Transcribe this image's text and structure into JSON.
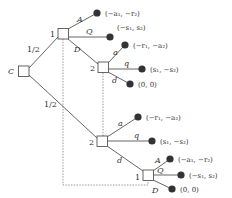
{
  "diagram": {
    "type": "extensive-form game tree",
    "colors": {
      "line": "#555555",
      "dotted": "#888888",
      "leaf": "#333333",
      "background": "#ffffff"
    },
    "nodes": {
      "chance": {
        "label": "C"
      },
      "p1_top": {
        "label": "1"
      },
      "p2_upper": {
        "label": "2"
      },
      "p2_lower": {
        "label": "2"
      },
      "p1_bottom": {
        "label": "1"
      }
    },
    "chance_probs": {
      "up": "1/2",
      "down": "1/2"
    },
    "actions": {
      "p1_top": {
        "A": "A",
        "Q": "Q",
        "D": "D"
      },
      "p2_upper": {
        "a": "a",
        "q": "q",
        "d": "d"
      },
      "p2_lower": {
        "a": "a",
        "q": "q",
        "d": "d"
      },
      "p1_bottom": {
        "A": "A",
        "Q": "Q",
        "D": "D"
      }
    },
    "payoffs": {
      "top_A": "(−a₁, −r₂)",
      "top_Q": "(−s₁, s₂)",
      "upper_a": "(−r₁, −a₂)",
      "upper_q": "(s₁, −s₂)",
      "upper_d": "(0, 0)",
      "lower_a": "(−r₁, −a₂)",
      "lower_q": "(s₁, −s₂)",
      "bottom_A": "(−a₁, −r₂)",
      "bottom_Q": "(−s₁, s₂)",
      "bottom_D": "(0, 0)"
    }
  }
}
